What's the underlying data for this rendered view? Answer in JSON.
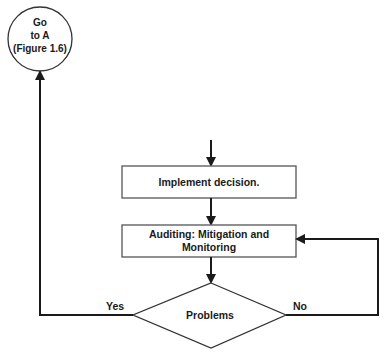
{
  "diagram": {
    "type": "flowchart",
    "colors": {
      "line": "#1a1a1a",
      "background": "#ffffff"
    },
    "nodes": {
      "goto_a": {
        "shape": "circle",
        "lines": [
          "Go",
          "to A",
          "(Figure 1.6)"
        ]
      },
      "implement": {
        "shape": "rectangle",
        "label": "Implement decision."
      },
      "auditing": {
        "shape": "rectangle",
        "lines": [
          "Auditing: Mitigation and",
          "Monitoring"
        ]
      },
      "problems": {
        "shape": "diamond",
        "label": "Problems"
      }
    },
    "edges": [
      {
        "from": "entry",
        "to": "implement"
      },
      {
        "from": "implement",
        "to": "auditing"
      },
      {
        "from": "auditing",
        "to": "problems"
      },
      {
        "from": "problems",
        "to": "goto_a",
        "label": "Yes"
      },
      {
        "from": "problems",
        "to": "auditing",
        "label": "No"
      }
    ],
    "edge_labels": {
      "yes": "Yes",
      "no": "No"
    }
  }
}
